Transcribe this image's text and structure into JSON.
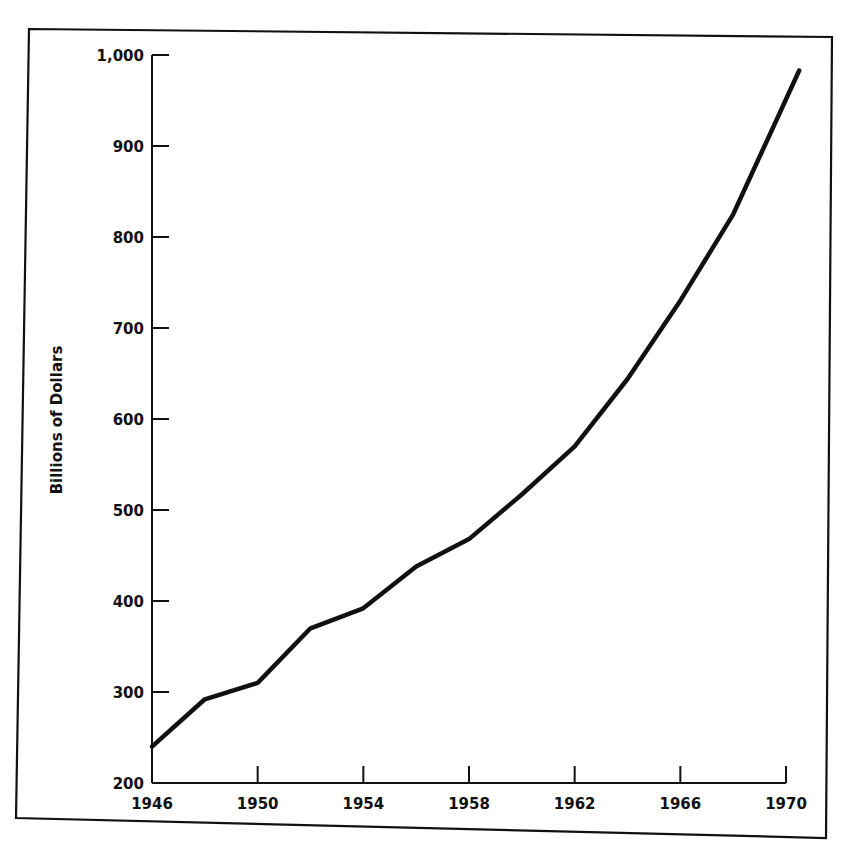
{
  "chart_data": {
    "type": "line",
    "title": "",
    "xlabel": "",
    "ylabel": "Billions of Dollars",
    "xlim": [
      1946,
      1970
    ],
    "ylim": [
      200,
      1000
    ],
    "grid": false,
    "legend": null,
    "x_ticks": [
      "1946",
      "1950",
      "1954",
      "1958",
      "1962",
      "1966",
      "1970"
    ],
    "y_ticks": [
      "200",
      "300",
      "400",
      "500",
      "600",
      "700",
      "800",
      "900",
      "1,000"
    ],
    "series": [
      {
        "name": "Billions of Dollars",
        "color": "#111111",
        "x": [
          1946,
          1948,
          1950,
          1952,
          1954,
          1956,
          1958,
          1960,
          1962,
          1964,
          1966,
          1968,
          1970.5
        ],
        "values": [
          240,
          292,
          310,
          370,
          392,
          438,
          468,
          517,
          570,
          644,
          730,
          825,
          983
        ]
      }
    ]
  },
  "colors": {
    "line": "#111111",
    "axis": "#111111",
    "frame": "#111111",
    "background": "#ffffff"
  }
}
